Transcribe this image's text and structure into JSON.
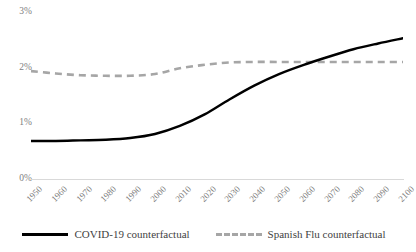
{
  "chart_data": {
    "type": "line",
    "title": "",
    "xlabel": "",
    "ylabel": "",
    "x": [
      1950,
      1960,
      1970,
      1980,
      1990,
      2000,
      2010,
      2020,
      2030,
      2040,
      2050,
      2060,
      2070,
      2080,
      2090,
      2100
    ],
    "xtick_labels": [
      "1950",
      "1960",
      "1970",
      "1980",
      "1990",
      "2000",
      "2010",
      "2020",
      "2030",
      "2040",
      "2050",
      "2060",
      "2070",
      "2080",
      "2090",
      "2100"
    ],
    "ytick_labels": [
      "0%",
      "1%",
      "2%",
      "3%"
    ],
    "ytick_values": [
      0,
      1,
      2,
      3
    ],
    "ylim": [
      0,
      3
    ],
    "xlim": [
      1950,
      2100
    ],
    "grid": false,
    "legend_position": "bottom",
    "series": [
      {
        "name": "COVID-19 counterfactual",
        "style": "solid",
        "color": "#000000",
        "values": [
          0.66,
          0.66,
          0.67,
          0.68,
          0.71,
          0.78,
          0.92,
          1.12,
          1.38,
          1.62,
          1.82,
          1.98,
          2.12,
          2.25,
          2.35,
          2.44
        ]
      },
      {
        "name": "Spanish Flu counterfactual",
        "style": "dashed",
        "color": "#a6a6a6",
        "values": [
          1.87,
          1.83,
          1.8,
          1.79,
          1.79,
          1.82,
          1.92,
          1.98,
          2.02,
          2.03,
          2.03,
          2.03,
          2.03,
          2.03,
          2.03,
          2.03
        ]
      }
    ],
    "annotations": {
      "crossover_year": 2075,
      "crossover_value": 2.03
    }
  },
  "axis": {
    "y_labels": [
      "3%",
      "2%",
      "1%",
      "0%"
    ],
    "baseline_color": "#d9d9d9",
    "tick_text_color": "#808080"
  },
  "legend": {
    "items": [
      {
        "label": "COVID-19 counterfactual",
        "style": "solid",
        "color": "#000000"
      },
      {
        "label": "Spanish Flu counterfactual",
        "style": "dashed",
        "color": "#a6a6a6"
      }
    ]
  }
}
